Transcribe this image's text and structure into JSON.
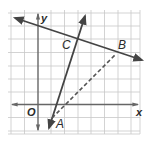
{
  "figure": {
    "type": "coordinate-plane-diagram",
    "grid": {
      "columns": 10,
      "rows": 9,
      "cell_px": 13.3,
      "color": "#c8c8c8"
    },
    "axes": {
      "x_label": "x",
      "y_label": "y",
      "origin_label": "O",
      "color": "#555555"
    },
    "points": [
      {
        "name": "A",
        "label": "A"
      },
      {
        "name": "B",
        "label": "B"
      },
      {
        "name": "C",
        "label": "C"
      }
    ],
    "lines": [
      {
        "name": "line-through-C-B",
        "style": "solid",
        "arrows": "both"
      },
      {
        "name": "line-through-A-C",
        "style": "solid",
        "arrows": "both"
      },
      {
        "name": "segment-A-B",
        "style": "dashed",
        "arrows": "none"
      }
    ],
    "colors": {
      "line": "#4a4a4a",
      "grid": "#c8c8c8",
      "background": "#ffffff"
    }
  }
}
